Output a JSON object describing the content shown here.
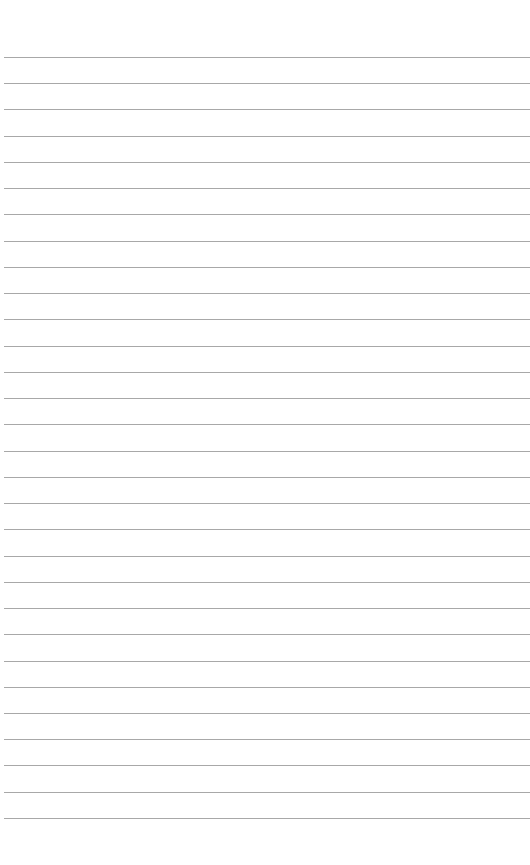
{
  "page": {
    "type": "lined-paper",
    "background_color": "#ffffff",
    "line_color": "#a8a8a8",
    "line_count": 30,
    "first_line_y": 57,
    "line_spacing": 26.24,
    "content": []
  }
}
